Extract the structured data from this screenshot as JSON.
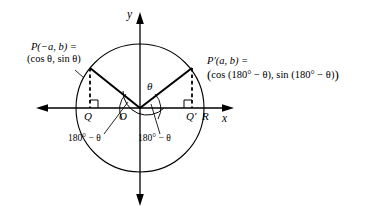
{
  "figure": {
    "type": "unit-circle-reference-angle-diagram",
    "axes": {
      "x_label": "x",
      "y_label": "y",
      "origin_label": "O"
    },
    "points": {
      "P": {
        "name": "P(−a, b) =",
        "coords": "(cos θ, sin θ)",
        "foot_label": "Q"
      },
      "P_prime": {
        "name": "P′(a, b) =",
        "coords_open": "(",
        "coords": "cos (180° − θ), sin (180° − θ)",
        "coords_close": ")",
        "foot_label": "Q′"
      },
      "R": {
        "label": "R"
      }
    },
    "angles": {
      "theta": "θ",
      "supplement_left": "180° − θ",
      "supplement_right": "180° − θ"
    },
    "colors": {
      "stroke": "#000000",
      "background": "#ffffff",
      "thin": "#1a1a1a"
    },
    "geometry": {
      "center_x": 140,
      "center_y": 108,
      "radius": 64,
      "p_x": 90,
      "p_y": 73,
      "pprime_x": 192,
      "pprime_y": 73
    }
  }
}
